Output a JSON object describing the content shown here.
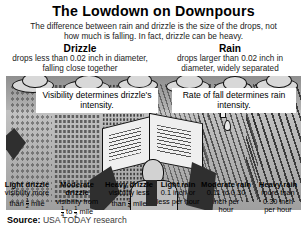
{
  "header": {
    "title": "The Lowdown on Downpours",
    "subtitle": "The difference between rain and drizzle is the size of the drops, not how much is falling. In fact, drizzle can be heavy."
  },
  "columns": {
    "drizzle": {
      "title": "Drizzle",
      "desc": "drops less than 0.02 inch in diameter, falling close together"
    },
    "rain": {
      "title": "Rain",
      "desc": "drops larger than 0.02 inch in diameter, widely separated"
    }
  },
  "callouts": {
    "drizzle": "Visibility determines drizzle's intensity.",
    "rain": "Rate of fall determines rain intensity."
  },
  "intensity_labels": [
    {
      "name": "Light drizzle",
      "line1": "visibility more",
      "line2_prefix": "than",
      "fraction_numerator": "1",
      "fraction_denominator": "2",
      "line2_suffix": "mile"
    },
    {
      "name": "Moderate drizzle",
      "line1": "visibility from",
      "line2_prefix": "",
      "fraction_numerator": "1",
      "fraction_denominator": "4",
      "mid": "to",
      "fraction2_numerator": "1",
      "fraction2_denominator": "2",
      "line2_suffix": "mile"
    },
    {
      "name": "Heavy drizzle",
      "line1": "visibility less",
      "line2_prefix": "than",
      "fraction_numerator": "1",
      "fraction_denominator": "4",
      "line2_suffix": "mile"
    },
    {
      "name": "Light rain",
      "line1": "0.1 inch or",
      "line2": "less per hour"
    },
    {
      "name": "Moderate rain",
      "line1": "0.11 to 0.30",
      "line2": "inch per",
      "line3": "hour"
    },
    {
      "name": "Heavy rain",
      "line1": "more than",
      "line2": "0.30 inch",
      "line3": "per hour"
    }
  ],
  "source": {
    "label": "Source:",
    "text": "USA TODAY research"
  },
  "colors": {
    "background": "#ffffff",
    "art_sky": "#8f8f8f",
    "art_ground": "#b9b9b9",
    "ink": "#111111"
  }
}
